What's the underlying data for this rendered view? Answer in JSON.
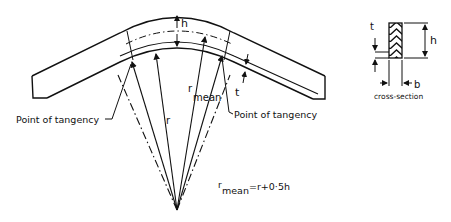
{
  "figure": {
    "labels": {
      "h": "h",
      "t": "t",
      "r": "r",
      "r_mean_r": "r",
      "r_mean_sub": "mean",
      "point_left": "Point of tangency",
      "point_right": "Point of tangency",
      "formula_r": "r",
      "formula_sub": "mean",
      "formula_rhs": "=r+0·5h"
    },
    "cross_section": {
      "t": "t",
      "h": "h",
      "b": "b",
      "caption": "cross-section"
    }
  }
}
